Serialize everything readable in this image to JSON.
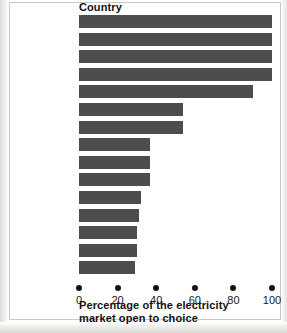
{
  "chart_data": {
    "type": "bar",
    "orientation": "horizontal",
    "title": "",
    "xlabel": "Percentage of the electricity market open to choice",
    "ylabel": "Country",
    "categories": [
      "United Kingdom",
      "Sweden",
      "Germany",
      "Finland",
      "Denmark",
      "Spain",
      "Luxembourg",
      "Netherlands",
      "Belgium",
      "Italy",
      "Austria",
      "Greece",
      "Ireland",
      "France",
      "Portugal"
    ],
    "values": [
      100,
      100,
      100,
      100,
      90,
      54,
      54,
      37,
      37,
      37,
      32,
      31,
      30,
      30,
      29
    ],
    "xlim": [
      0,
      100
    ],
    "xticks": [
      0,
      20,
      40,
      60,
      80,
      100
    ],
    "xtick_labels": [
      "0",
      "20",
      "40",
      "60",
      "80",
      "100"
    ],
    "grid": false,
    "legend": false,
    "bar_color": "#4d4d4d",
    "background_color": "#ffffff"
  },
  "axis": {
    "column_header": "Country",
    "title_line1": "Percentage of the electricity",
    "title_line2": "market open to choice"
  }
}
